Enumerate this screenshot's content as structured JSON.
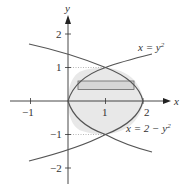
{
  "figure": {
    "axes": {
      "x_label": "x",
      "y_label": "y",
      "x_ticks": [
        {
          "value": -1,
          "label": "−1"
        },
        {
          "value": 1,
          "label": "1"
        },
        {
          "value": 2,
          "label": "2"
        }
      ],
      "y_ticks": [
        {
          "value": 2,
          "label": "2"
        },
        {
          "value": 1,
          "label": "1"
        },
        {
          "value": -1,
          "label": "−1"
        },
        {
          "value": -2,
          "label": "−2"
        }
      ]
    },
    "curves": [
      {
        "name": "parabola-right",
        "equation_lhs": "x = y",
        "exponent": "2"
      },
      {
        "name": "parabola-left",
        "equation_lhs": "x = 2 − y",
        "exponent": "2"
      }
    ],
    "region": {
      "description": "region between x = y^2 and x = 2 - y^2",
      "fill": "#e6e6e6"
    },
    "strip": {
      "description": "horizontal representative rectangle",
      "fill": "#d9d9d9"
    },
    "intersections": [
      [
        1,
        1
      ],
      [
        1,
        -1
      ]
    ],
    "colors": {
      "curve": "#555555",
      "axis": "#333333",
      "dotted": "#888888"
    }
  }
}
